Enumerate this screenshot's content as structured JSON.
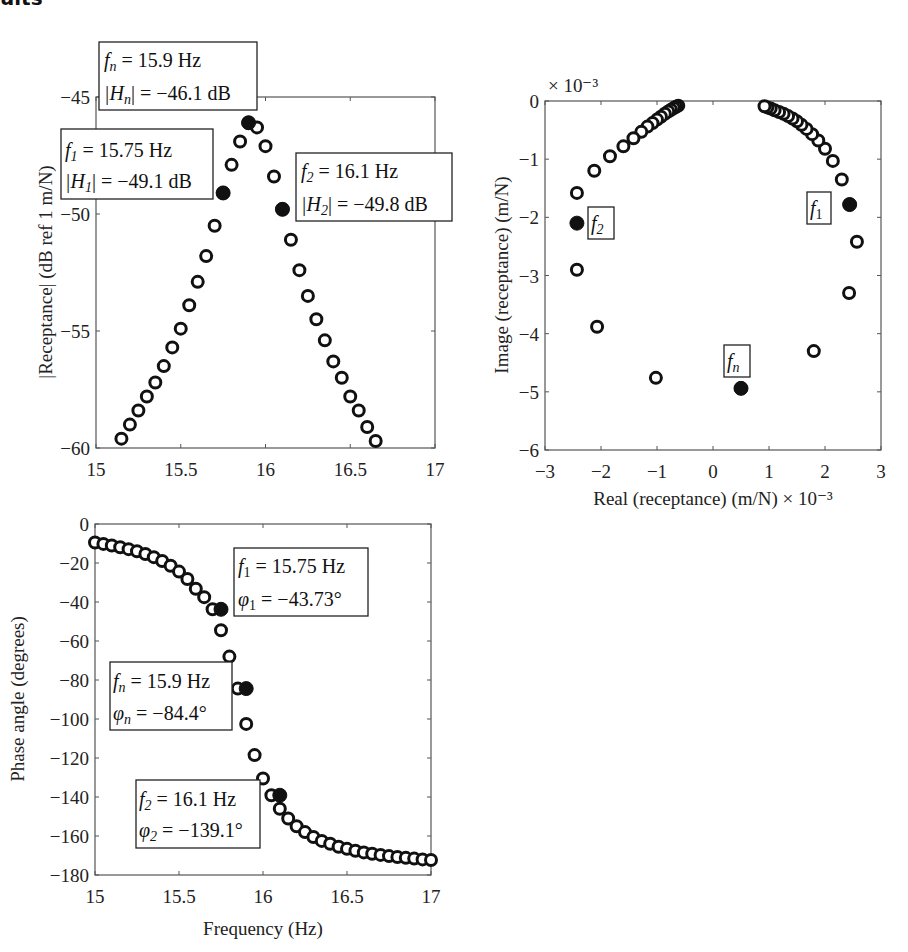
{
  "page": {
    "cropped_heading": "ults"
  },
  "chart_data": [
    {
      "id": "magnitude",
      "type": "scatter",
      "title": "",
      "xlabel": "",
      "ylabel": "|Receptance| (dB ref 1 m/N)",
      "xlim": [
        15,
        17
      ],
      "ylim": [
        -60,
        -45
      ],
      "xticks": [
        15,
        15.5,
        16,
        16.5,
        17
      ],
      "xtick_labels": [
        "15",
        "15.5",
        "16",
        "16.5",
        "17"
      ],
      "yticks": [
        -45,
        -50,
        -55,
        -60
      ],
      "ytick_labels": [
        "−45",
        "−50",
        "−55",
        "−60"
      ],
      "grid": false,
      "x": [
        15.15,
        15.2,
        15.25,
        15.3,
        15.35,
        15.4,
        15.45,
        15.5,
        15.55,
        15.6,
        15.65,
        15.7,
        15.75,
        15.8,
        15.85,
        15.9,
        15.95,
        16.0,
        16.05,
        16.1,
        16.15,
        16.2,
        16.25,
        16.3,
        16.35,
        16.4,
        16.45,
        16.5,
        16.55,
        16.6,
        16.65
      ],
      "y": [
        -59.6,
        -59.0,
        -58.4,
        -57.8,
        -57.2,
        -56.5,
        -55.7,
        -54.9,
        -53.9,
        -52.9,
        -51.8,
        -50.5,
        -49.1,
        -47.9,
        -46.9,
        -46.1,
        -46.3,
        -47.1,
        -48.4,
        -49.8,
        -51.1,
        -52.4,
        -53.5,
        -54.5,
        -55.4,
        -56.3,
        -57.0,
        -57.8,
        -58.4,
        -59.1,
        -59.7
      ],
      "highlighted": [
        {
          "x": 15.75,
          "y": -49.1
        },
        {
          "x": 15.9,
          "y": -46.1
        },
        {
          "x": 16.1,
          "y": -49.8
        }
      ],
      "annotations": [
        {
          "line1_sym": "f",
          "line1_sub": "n",
          "line1_rest": " = 15.9 Hz",
          "line2_sym": "|H",
          "line2_sub": "n",
          "line2_rest": "| = −46.1 dB"
        },
        {
          "line1_sym": "f",
          "line1_sub": "1",
          "line1_rest": " = 15.75 Hz",
          "line2_sym": "|H",
          "line2_sub": "1",
          "line2_rest": "| = −49.1 dB"
        },
        {
          "line1_sym": "f",
          "line1_sub": "2",
          "line1_rest": " = 16.1 Hz",
          "line2_sym": "|H",
          "line2_sub": "2",
          "line2_rest": "| = −49.8 dB"
        }
      ]
    },
    {
      "id": "nyquist",
      "type": "scatter",
      "title": "",
      "xlabel": "Real (receptance) (m/N) × 10⁻³",
      "ylabel": "Image (receptance) (m/N)",
      "y_exponent_label": "× 10⁻³",
      "xlim": [
        -3,
        3
      ],
      "ylim": [
        -6,
        0
      ],
      "xticks": [
        -3,
        -2,
        -1,
        0,
        1,
        2,
        3
      ],
      "xtick_labels": [
        "−3",
        "−2",
        "−1",
        "0",
        "1",
        "2",
        "3"
      ],
      "yticks": [
        0,
        -1,
        -2,
        -3,
        -4,
        -5,
        -6
      ],
      "ytick_labels": [
        "0",
        "−1",
        "−2",
        "−3",
        "−4",
        "−5",
        "−6"
      ],
      "grid": false,
      "x": [
        -0.62,
        -0.66,
        -0.7,
        -0.75,
        -0.8,
        -0.86,
        -0.93,
        -1.0,
        -1.08,
        -1.17,
        -1.28,
        -1.42,
        -1.6,
        -1.84,
        -2.12,
        -2.43,
        -2.43,
        -2.07,
        -1.02,
        0.5,
        1.8,
        2.43,
        2.57,
        2.44,
        2.3,
        2.14,
        2.0,
        1.88,
        1.77,
        1.67,
        1.58,
        1.5,
        1.42,
        1.34,
        1.26,
        1.18,
        1.1,
        1.03,
        0.97,
        0.92
      ],
      "y": [
        -0.08,
        -0.1,
        -0.12,
        -0.15,
        -0.18,
        -0.22,
        -0.27,
        -0.32,
        -0.38,
        -0.44,
        -0.53,
        -0.64,
        -0.78,
        -0.95,
        -1.2,
        -1.58,
        -2.9,
        -3.88,
        -4.76,
        -4.94,
        -4.3,
        -3.3,
        -2.42,
        -1.78,
        -1.35,
        -1.03,
        -0.82,
        -0.68,
        -0.57,
        -0.48,
        -0.41,
        -0.35,
        -0.3,
        -0.26,
        -0.22,
        -0.19,
        -0.16,
        -0.13,
        -0.11,
        -0.09
      ],
      "highlighted": [
        {
          "x": 2.44,
          "y": -1.78,
          "label": "f1"
        },
        {
          "x": 0.5,
          "y": -4.94,
          "label": "fn"
        },
        {
          "x": -2.43,
          "y": -2.1,
          "label": "f2"
        }
      ],
      "annotations": [
        {
          "sym": "f",
          "sub": "1"
        },
        {
          "sym": "f",
          "sub": "2"
        },
        {
          "sym": "f",
          "sub": "n"
        }
      ]
    },
    {
      "id": "phase",
      "type": "scatter",
      "title": "",
      "xlabel": "Frequency (Hz)",
      "ylabel": "Phase angle (degrees)",
      "xlim": [
        15,
        17
      ],
      "ylim": [
        -180,
        0
      ],
      "xticks": [
        15,
        15.5,
        16,
        16.5,
        17
      ],
      "xtick_labels": [
        "15",
        "15.5",
        "16",
        "16.5",
        "17"
      ],
      "yticks": [
        0,
        -20,
        -40,
        -60,
        -80,
        -100,
        -120,
        -140,
        -160,
        -180
      ],
      "ytick_labels": [
        "0",
        "−20",
        "−40",
        "−60",
        "−80",
        "−100",
        "−120",
        "−140",
        "−160",
        "−180"
      ],
      "grid": false,
      "x": [
        15.0,
        15.05,
        15.1,
        15.15,
        15.2,
        15.25,
        15.3,
        15.35,
        15.4,
        15.45,
        15.5,
        15.55,
        15.6,
        15.65,
        15.7,
        15.75,
        15.8,
        15.85,
        15.9,
        15.95,
        16.0,
        16.05,
        16.1,
        16.15,
        16.2,
        16.25,
        16.3,
        16.35,
        16.4,
        16.45,
        16.5,
        16.55,
        16.6,
        16.65,
        16.7,
        16.75,
        16.8,
        16.85,
        16.9,
        16.95,
        17.0
      ],
      "y": [
        -9.5,
        -10.2,
        -11.0,
        -11.9,
        -12.9,
        -14.0,
        -15.4,
        -17.0,
        -19.0,
        -21.4,
        -24.4,
        -28.2,
        -33.2,
        -37.5,
        -43.73,
        -54.5,
        -68.0,
        -84.4,
        -102.5,
        -118.5,
        -130.5,
        -139.1,
        -146.0,
        -151.0,
        -155.0,
        -158.0,
        -160.5,
        -162.5,
        -164.0,
        -165.5,
        -166.6,
        -167.6,
        -168.4,
        -169.1,
        -169.7,
        -170.3,
        -170.8,
        -171.2,
        -171.6,
        -172.0,
        -172.3
      ],
      "highlighted": [
        {
          "x": 15.75,
          "y": -43.73
        },
        {
          "x": 15.9,
          "y": -84.4
        },
        {
          "x": 16.1,
          "y": -139.1
        }
      ],
      "annotations": [
        {
          "line1_sym": "f",
          "line1_sub": "1",
          "line1_rest": " = 15.75 Hz",
          "line2_sym": "φ",
          "line2_sub": "1",
          "line2_rest": " = −43.73°"
        },
        {
          "line1_sym": "f",
          "line1_sub": "n",
          "line1_rest": " = 15.9 Hz",
          "line2_sym": "φ",
          "line2_sub": "n",
          "line2_rest": " = −84.4°"
        },
        {
          "line1_sym": "f",
          "line1_sub": "2",
          "line1_rest": " = 16.1 Hz",
          "line2_sym": "φ",
          "line2_sub": "2",
          "line2_rest": " = −139.1°"
        }
      ]
    }
  ]
}
